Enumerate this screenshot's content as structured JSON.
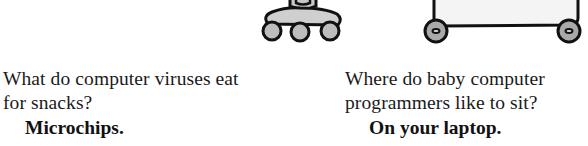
{
  "illustrations": [
    {
      "name": "robot-base-illustration",
      "fill": "#bdbdbd",
      "stroke": "#111111"
    },
    {
      "name": "laptop-cart-illustration",
      "fill": "#f4f4f4",
      "wheel_fill": "#a9a9a9",
      "stroke": "#111111"
    }
  ],
  "jokes": [
    {
      "question_line1": "What do computer viruses eat",
      "question_line2": "for snacks?",
      "answer": "Microchips."
    },
    {
      "question_line1": "Where do baby computer",
      "question_line2": "programmers like to sit?",
      "answer": "On your laptop."
    }
  ]
}
